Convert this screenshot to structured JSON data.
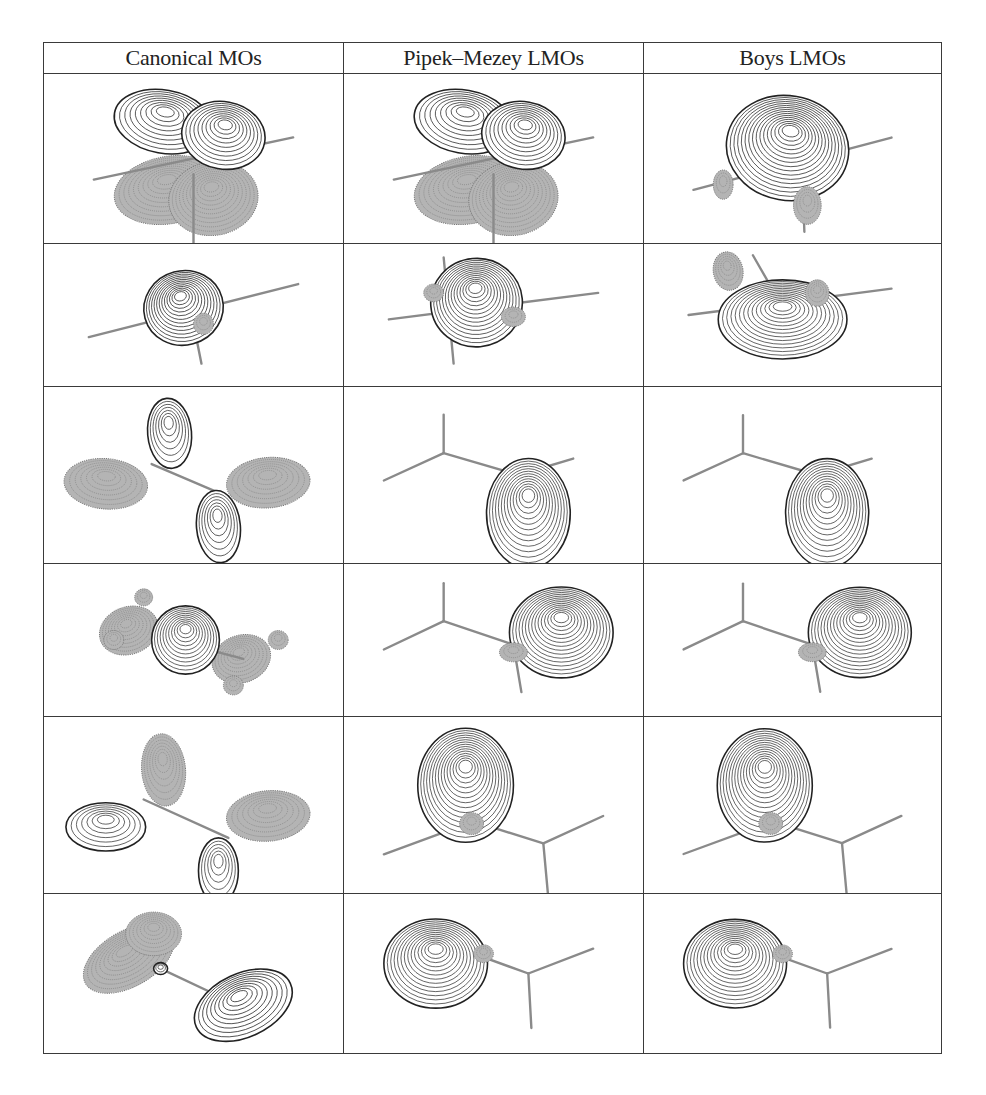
{
  "figure": {
    "headers": [
      "Canonical MOs",
      "Pipek–Mezey LMOs",
      "Boys LMOs"
    ],
    "row_heights": [
      169,
      142,
      176,
      152,
      176,
      159
    ],
    "colors": {
      "border": "#3a3a3a",
      "bond": "#8a8a8a",
      "positive_lobe_fill": "#ffffff",
      "positive_lobe_line": "#222222",
      "negative_lobe_fill": "#b4b4b4",
      "negative_lobe_line": "#7a7a7a"
    },
    "rows": [
      {
        "cells": [
          {
            "name": "canonical-mo-1",
            "desc": "pi bonding MO, two-center lobes above and below ethylene plane",
            "bonds": [
              [
                50,
                100,
                250,
                60
              ],
              [
                150,
                95,
                150,
                160
              ]
            ],
            "lobes": [
              {
                "cx": 125,
                "cy": 110,
                "rx": 55,
                "ry": 32,
                "rot": -10,
                "sign": "neg"
              },
              {
                "cx": 170,
                "cy": 118,
                "rx": 45,
                "ry": 35,
                "rot": -10,
                "sign": "neg"
              },
              {
                "cx": 120,
                "cy": 45,
                "rx": 50,
                "ry": 30,
                "rot": 10,
                "sign": "pos"
              },
              {
                "cx": 180,
                "cy": 58,
                "rx": 42,
                "ry": 32,
                "rot": 10,
                "sign": "pos"
              }
            ]
          },
          {
            "name": "pipek-mezey-lmo-1",
            "desc": "pi LMO identical to canonical",
            "bonds": [
              [
                50,
                100,
                250,
                60
              ],
              [
                150,
                95,
                150,
                160
              ]
            ],
            "lobes": [
              {
                "cx": 125,
                "cy": 110,
                "rx": 55,
                "ry": 32,
                "rot": -10,
                "sign": "neg"
              },
              {
                "cx": 170,
                "cy": 118,
                "rx": 45,
                "ry": 35,
                "rot": -10,
                "sign": "neg"
              },
              {
                "cx": 120,
                "cy": 45,
                "rx": 50,
                "ry": 30,
                "rot": 10,
                "sign": "pos"
              },
              {
                "cx": 180,
                "cy": 58,
                "rx": 42,
                "ry": 32,
                "rot": 10,
                "sign": "pos"
              }
            ]
          },
          {
            "name": "boys-lmo-1",
            "desc": "banana bond LMO",
            "bonds": [
              [
                50,
                110,
                250,
                60
              ],
              [
                160,
                95,
                162,
                150
              ]
            ],
            "lobes": [
              {
                "cx": 80,
                "cy": 105,
                "rx": 10,
                "ry": 14,
                "rot": 0,
                "sign": "neg"
              },
              {
                "cx": 165,
                "cy": 125,
                "rx": 14,
                "ry": 18,
                "rot": 0,
                "sign": "neg"
              },
              {
                "cx": 145,
                "cy": 70,
                "rx": 62,
                "ry": 50,
                "rot": 10,
                "sign": "pos"
              }
            ]
          }
        ]
      },
      {
        "cells": [
          {
            "name": "canonical-mo-2",
            "desc": "sigma C-C bonding MO",
            "bonds": [
              [
                45,
                105,
                255,
                45
              ],
              [
                150,
                90,
                158,
                135
              ]
            ],
            "lobes": [
              {
                "cx": 140,
                "cy": 72,
                "rx": 40,
                "ry": 42,
                "rot": -15,
                "sign": "pos"
              },
              {
                "cx": 160,
                "cy": 90,
                "rx": 10,
                "ry": 12,
                "rot": 0,
                "sign": "neg"
              }
            ]
          },
          {
            "name": "pipek-mezey-lmo-2",
            "desc": "sigma C-C LMO with small H lobes",
            "bonds": [
              [
                45,
                85,
                255,
                55
              ],
              [
                100,
                15,
                110,
                135
              ]
            ],
            "lobes": [
              {
                "cx": 90,
                "cy": 55,
                "rx": 10,
                "ry": 10,
                "rot": 0,
                "sign": "neg"
              },
              {
                "cx": 170,
                "cy": 82,
                "rx": 12,
                "ry": 11,
                "rot": 0,
                "sign": "neg"
              },
              {
                "cx": 133,
                "cy": 66,
                "rx": 46,
                "ry": 50,
                "rot": -5,
                "sign": "pos"
              }
            ]
          },
          {
            "name": "boys-lmo-2",
            "desc": "banana bond LMO with H lobes",
            "bonds": [
              [
                45,
                80,
                250,
                50
              ],
              [
                110,
                12,
                160,
                110
              ]
            ],
            "lobes": [
              {
                "cx": 85,
                "cy": 30,
                "rx": 15,
                "ry": 22,
                "rot": -10,
                "sign": "neg"
              },
              {
                "cx": 175,
                "cy": 55,
                "rx": 12,
                "ry": 15,
                "rot": 0,
                "sign": "neg"
              },
              {
                "cx": 140,
                "cy": 85,
                "rx": 65,
                "ry": 45,
                "rot": 0,
                "sign": "pos"
              }
            ]
          }
        ]
      },
      {
        "cells": [
          {
            "name": "canonical-mo-3",
            "desc": "four-lobe CH pi-type MO",
            "bonds": [
              [
                108,
                70,
                185,
                100
              ]
            ],
            "lobes": [
              {
                "cx": 62,
                "cy": 88,
                "rx": 42,
                "ry": 23,
                "rot": 5,
                "sign": "neg"
              },
              {
                "cx": 225,
                "cy": 87,
                "rx": 42,
                "ry": 23,
                "rot": -5,
                "sign": "neg"
              },
              {
                "cx": 126,
                "cy": 42,
                "rx": 22,
                "ry": 32,
                "rot": -5,
                "sign": "pos"
              },
              {
                "cx": 175,
                "cy": 127,
                "rx": 22,
                "ry": 33,
                "rot": -5,
                "sign": "pos"
              }
            ]
          },
          {
            "name": "pipek-mezey-lmo-3",
            "desc": "lone-pair-like LMO",
            "bonds": [
              [
                40,
                85,
                100,
                60
              ],
              [
                100,
                60,
                100,
                25
              ],
              [
                100,
                60,
                175,
                80
              ],
              [
                175,
                80,
                230,
                65
              ]
            ],
            "lobes": [
              {
                "cx": 185,
                "cy": 115,
                "rx": 42,
                "ry": 50,
                "rot": 0,
                "sign": "pos"
              }
            ]
          },
          {
            "name": "boys-lmo-3",
            "desc": "lone-pair-like LMO",
            "bonds": [
              [
                40,
                85,
                100,
                60
              ],
              [
                100,
                60,
                100,
                25
              ],
              [
                100,
                60,
                175,
                80
              ],
              [
                175,
                80,
                230,
                65
              ]
            ],
            "lobes": [
              {
                "cx": 185,
                "cy": 115,
                "rx": 42,
                "ry": 50,
                "rot": 0,
                "sign": "pos"
              }
            ]
          }
        ]
      },
      {
        "cells": [
          {
            "name": "canonical-mo-4",
            "desc": "delocalized MO with lobes on C-H",
            "bonds": [
              [
                110,
                75,
                200,
                100
              ]
            ],
            "lobes": [
              {
                "cx": 85,
                "cy": 70,
                "rx": 30,
                "ry": 25,
                "rot": -20,
                "sign": "neg"
              },
              {
                "cx": 70,
                "cy": 80,
                "rx": 10,
                "ry": 10,
                "rot": 0,
                "sign": "neg"
              },
              {
                "cx": 100,
                "cy": 35,
                "rx": 9,
                "ry": 9,
                "rot": 0,
                "sign": "neg"
              },
              {
                "cx": 198,
                "cy": 100,
                "rx": 30,
                "ry": 25,
                "rot": -20,
                "sign": "neg"
              },
              {
                "cx": 235,
                "cy": 80,
                "rx": 10,
                "ry": 10,
                "rot": 0,
                "sign": "neg"
              },
              {
                "cx": 190,
                "cy": 128,
                "rx": 10,
                "ry": 10,
                "rot": 0,
                "sign": "neg"
              },
              {
                "cx": 142,
                "cy": 80,
                "rx": 34,
                "ry": 36,
                "rot": 0,
                "sign": "pos"
              }
            ]
          },
          {
            "name": "pipek-mezey-lmo-4",
            "desc": "C-H bond LMO",
            "bonds": [
              [
                40,
                90,
                100,
                60
              ],
              [
                100,
                60,
                100,
                20
              ],
              [
                100,
                60,
                170,
                85
              ],
              [
                170,
                85,
                178,
                135
              ]
            ],
            "lobes": [
              {
                "cx": 170,
                "cy": 93,
                "rx": 14,
                "ry": 10,
                "rot": 0,
                "sign": "neg"
              },
              {
                "cx": 218,
                "cy": 72,
                "rx": 52,
                "ry": 48,
                "rot": 0,
                "sign": "pos"
              }
            ]
          },
          {
            "name": "boys-lmo-4",
            "desc": "C-H bond LMO",
            "bonds": [
              [
                40,
                90,
                100,
                60
              ],
              [
                100,
                60,
                100,
                20
              ],
              [
                100,
                60,
                170,
                85
              ],
              [
                170,
                85,
                178,
                135
              ]
            ],
            "lobes": [
              {
                "cx": 170,
                "cy": 93,
                "rx": 14,
                "ry": 10,
                "rot": 0,
                "sign": "neg"
              },
              {
                "cx": 218,
                "cy": 72,
                "rx": 52,
                "ry": 48,
                "rot": 0,
                "sign": "pos"
              }
            ]
          }
        ]
      },
      {
        "cells": [
          {
            "name": "canonical-mo-5",
            "desc": "four-lobe CH MO, alternate phases",
            "bonds": [
              [
                100,
                75,
                185,
                110
              ]
            ],
            "lobes": [
              {
                "cx": 120,
                "cy": 48,
                "rx": 22,
                "ry": 33,
                "rot": -5,
                "sign": "neg"
              },
              {
                "cx": 225,
                "cy": 90,
                "rx": 42,
                "ry": 23,
                "rot": -5,
                "sign": "neg"
              },
              {
                "cx": 62,
                "cy": 100,
                "rx": 40,
                "ry": 22,
                "rot": 0,
                "sign": "pos"
              },
              {
                "cx": 175,
                "cy": 140,
                "rx": 20,
                "ry": 30,
                "rot": 0,
                "sign": "pos"
              }
            ]
          },
          {
            "name": "pipek-mezey-lmo-5",
            "desc": "C-H bond LMO",
            "bonds": [
              [
                40,
                125,
                130,
                95
              ],
              [
                130,
                95,
                200,
                115
              ],
              [
                200,
                115,
                260,
                90
              ],
              [
                200,
                115,
                205,
                165
              ]
            ],
            "lobes": [
              {
                "cx": 128,
                "cy": 97,
                "rx": 12,
                "ry": 10,
                "rot": 0,
                "sign": "neg"
              },
              {
                "cx": 122,
                "cy": 62,
                "rx": 48,
                "ry": 52,
                "rot": 0,
                "sign": "pos"
              }
            ]
          },
          {
            "name": "boys-lmo-5",
            "desc": "C-H bond LMO",
            "bonds": [
              [
                40,
                125,
                130,
                95
              ],
              [
                130,
                95,
                200,
                115
              ],
              [
                200,
                115,
                260,
                90
              ],
              [
                200,
                115,
                205,
                165
              ]
            ],
            "lobes": [
              {
                "cx": 128,
                "cy": 97,
                "rx": 12,
                "ry": 10,
                "rot": 0,
                "sign": "neg"
              },
              {
                "cx": 122,
                "cy": 62,
                "rx": 48,
                "ry": 52,
                "rot": 0,
                "sign": "pos"
              }
            ]
          }
        ]
      },
      {
        "cells": [
          {
            "name": "canonical-mo-6",
            "desc": "delocalized C-H MO",
            "bonds": [
              [
                117,
                75,
                180,
                105
              ]
            ],
            "lobes": [
              {
                "cx": 85,
                "cy": 65,
                "rx": 50,
                "ry": 28,
                "rot": -30,
                "sign": "neg"
              },
              {
                "cx": 110,
                "cy": 40,
                "rx": 28,
                "ry": 22,
                "rot": 0,
                "sign": "neg"
              },
              {
                "cx": 200,
                "cy": 112,
                "rx": 52,
                "ry": 32,
                "rot": -25,
                "sign": "pos"
              },
              {
                "cx": 117,
                "cy": 75,
                "rx": 7,
                "ry": 6,
                "rot": 0,
                "sign": "pos"
              }
            ]
          },
          {
            "name": "pipek-mezey-lmo-6",
            "desc": "C-H bond LMO",
            "bonds": [
              [
                130,
                60,
                185,
                80
              ],
              [
                185,
                80,
                250,
                55
              ],
              [
                185,
                80,
                188,
                135
              ],
              [
                100,
                60,
                140,
                55
              ]
            ],
            "lobes": [
              {
                "cx": 140,
                "cy": 60,
                "rx": 10,
                "ry": 9,
                "rot": 0,
                "sign": "neg"
              },
              {
                "cx": 92,
                "cy": 70,
                "rx": 52,
                "ry": 45,
                "rot": 0,
                "sign": "pos"
              }
            ]
          },
          {
            "name": "boys-lmo-6",
            "desc": "C-H bond LMO",
            "bonds": [
              [
                130,
                60,
                185,
                80
              ],
              [
                185,
                80,
                250,
                55
              ],
              [
                185,
                80,
                188,
                135
              ],
              [
                100,
                60,
                140,
                55
              ]
            ],
            "lobes": [
              {
                "cx": 140,
                "cy": 60,
                "rx": 10,
                "ry": 9,
                "rot": 0,
                "sign": "neg"
              },
              {
                "cx": 92,
                "cy": 70,
                "rx": 52,
                "ry": 45,
                "rot": 0,
                "sign": "pos"
              }
            ]
          }
        ]
      }
    ]
  }
}
